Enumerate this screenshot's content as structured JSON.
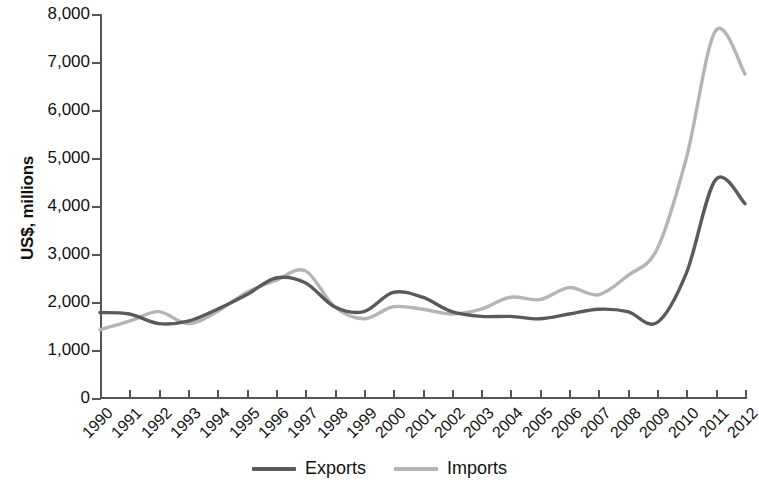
{
  "chart_data": {
    "type": "line",
    "title": "",
    "subtitle": "",
    "xlabel": "",
    "ylabel": "US$, millions",
    "ylim": [
      0,
      8000
    ],
    "ytick_step": 1000,
    "grid": false,
    "legend_position": "bottom-center",
    "categories": [
      "1990",
      "1991",
      "1992",
      "1993",
      "1994",
      "1995",
      "1996",
      "1997",
      "1998",
      "1999",
      "2000",
      "2001",
      "2002",
      "2003",
      "2004",
      "2005",
      "2006",
      "2007",
      "2008",
      "2009",
      "2010",
      "2011",
      "2012"
    ],
    "ytick_labels": [
      "8,000",
      "7,000",
      "6,000",
      "5,000",
      "4,000",
      "3,000",
      "2,000",
      "1,000",
      "0"
    ],
    "ytick_values": [
      8000,
      7000,
      6000,
      5000,
      4000,
      3000,
      2000,
      1000,
      0
    ],
    "series": [
      {
        "name": "Exports",
        "color": "#5a5a5a",
        "line_width": 3.4,
        "values": [
          1780,
          1750,
          1550,
          1600,
          1850,
          2150,
          2500,
          2400,
          1900,
          1800,
          2200,
          2100,
          1800,
          1700,
          1700,
          1650,
          1750,
          1850,
          1800,
          1570,
          2600,
          4550,
          4050
        ]
      },
      {
        "name": "Imports",
        "color": "#b4b4b4",
        "line_width": 3.4,
        "values": [
          1420,
          1600,
          1800,
          1550,
          1800,
          2200,
          2450,
          2650,
          1900,
          1650,
          1900,
          1850,
          1750,
          1850,
          2100,
          2050,
          2300,
          2150,
          2550,
          3100,
          5000,
          7650,
          6750
        ]
      }
    ]
  },
  "legend": {
    "items": [
      {
        "label": "Exports",
        "color": "#5a5a5a"
      },
      {
        "label": "Imports",
        "color": "#b4b4b4"
      }
    ]
  },
  "axes": {
    "y_title": "US$, millions",
    "axis_color": "#555555"
  }
}
